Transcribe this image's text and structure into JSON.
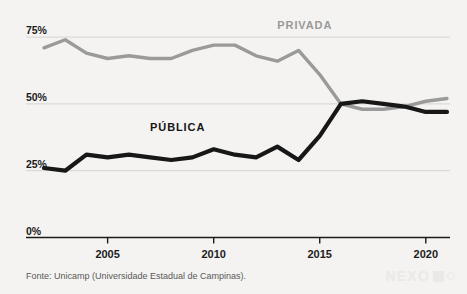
{
  "chart_data": {
    "type": "line",
    "title": "",
    "subtitle": "",
    "xlabel": "",
    "ylabel": "",
    "xlim": [
      2002,
      2021
    ],
    "ylim": [
      0,
      82
    ],
    "grid": true,
    "legend_position": "inline",
    "y_ticks": [
      "0%",
      "25%",
      "50%",
      "75%"
    ],
    "y_tick_values": [
      0,
      25,
      50,
      75
    ],
    "x_ticks": [
      "2005",
      "2010",
      "2015",
      "2020"
    ],
    "x_tick_values": [
      2005,
      2010,
      2015,
      2020
    ],
    "x": [
      2002,
      2003,
      2004,
      2005,
      2006,
      2007,
      2008,
      2009,
      2010,
      2011,
      2012,
      2013,
      2014,
      2015,
      2016,
      2017,
      2018,
      2019,
      2020,
      2021
    ],
    "series": [
      {
        "name": "PRIVADA",
        "color": "#9a9a9a",
        "values": [
          71,
          74,
          69,
          67,
          68,
          67,
          67,
          70,
          72,
          72,
          68,
          66,
          70,
          61,
          50,
          48,
          48,
          49,
          51,
          52
        ]
      },
      {
        "name": "PÚBLICA",
        "color": "#171717",
        "values": [
          26,
          25,
          31,
          30,
          31,
          30,
          29,
          30,
          33,
          31,
          30,
          34,
          29,
          38,
          50,
          51,
          50,
          49,
          47,
          47
        ]
      }
    ],
    "annotations": [
      {
        "text": "PRIVADA",
        "x": 2013,
        "y": 79,
        "color": "#9a9a9a"
      },
      {
        "text": "PÚBLICA",
        "x": 2007,
        "y": 41,
        "color": "#171717"
      }
    ]
  },
  "footer": {
    "source": "Fonte: Unicamp (Universidade Estadual de Campinas)."
  },
  "watermark": {
    "brand": "NEXO"
  },
  "colors": {
    "background": "#f4f3f1",
    "grid": "#d6d4d1",
    "axis": "#1c1c1c",
    "privada": "#9a9a9a",
    "publica": "#171717"
  }
}
